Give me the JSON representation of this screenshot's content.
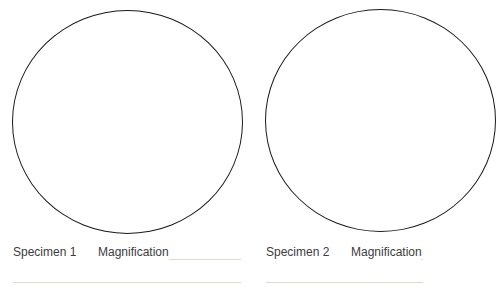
{
  "specimens": [
    {
      "label": "Specimen 1",
      "magnification_label": "Magnification",
      "magnification_value": ""
    },
    {
      "label": "Specimen 2",
      "magnification_label": "Magnification",
      "magnification_value": ""
    }
  ],
  "colors": {
    "circle_stroke": "#1a1a1a",
    "line": "#dcdcc4",
    "text": "#3c3c3c"
  }
}
